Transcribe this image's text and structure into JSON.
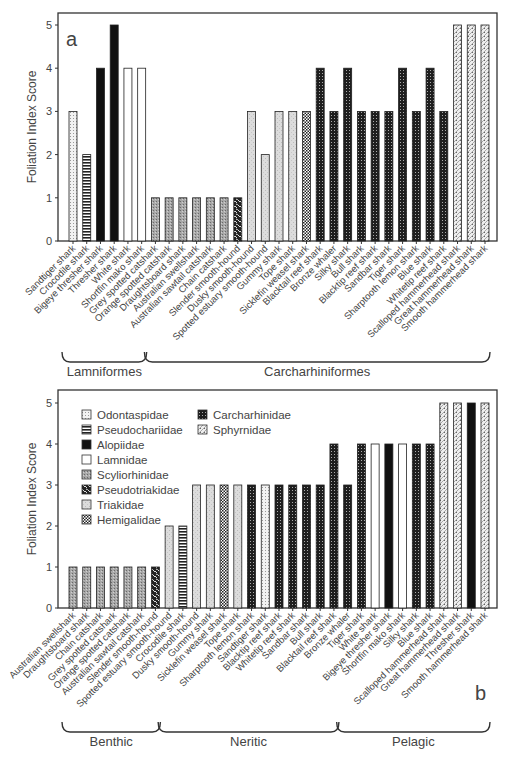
{
  "colors": {
    "frame": "#333333",
    "text": "#444444",
    "Odontaspidae": "#e4e4e4",
    "Pseudochariidae": "#222222",
    "Alopiidae": "#111111",
    "Lamnidae": "#ffffff",
    "Scyliorhinidae": "#9a9a9a",
    "Pseudotriakidae": "#2a2a2a",
    "Triakidae": "#d6d6d6",
    "Hemigalidae": "#555555",
    "Carcharhinidae": "#1e1e1e",
    "Sphyrnidae": "#cfcfcf"
  },
  "legend": {
    "entries": [
      {
        "family": "Odontaspidae"
      },
      {
        "family": "Pseudochariidae"
      },
      {
        "family": "Alopiidae"
      },
      {
        "family": "Lamnidae"
      },
      {
        "family": "Scyliorhinidae"
      },
      {
        "family": "Pseudotriakidae"
      },
      {
        "family": "Triakidae"
      },
      {
        "family": "Hemigalidae"
      },
      {
        "family": "Carcharhinidae"
      },
      {
        "family": "Sphyrnidae"
      }
    ]
  },
  "chart_data": [
    {
      "type": "bar",
      "panel_label": "a",
      "title": "",
      "xlabel": "",
      "ylabel": "Foliation Index Score",
      "ylim": [
        0,
        5
      ],
      "yticks": [
        0,
        1,
        2,
        3,
        4,
        5
      ],
      "grid": false,
      "categories": [
        "Sandtiger shark",
        "Crocodile shark",
        "Bigeye thresher shark",
        "Thresher shark",
        "White shark",
        "Shortfin mako shark",
        "Grey spotted catshark",
        "Orange spotted catshark",
        "Draughtsboard shark",
        "Australian swellshark",
        "Australian sawtail catshark",
        "Chain catshark",
        "Slender smooth-hound",
        "Dusky smooth-hound",
        "Spotted estuary smooth-hound",
        "Gummy shark",
        "Tope shark",
        "Sicklefin weasel shark",
        "Blacktail reef shark",
        "Bronze whaler",
        "Silky shark",
        "Bull shark",
        "Blacktip reef shark",
        "Sandbar shark",
        "Tiger shark",
        "Sharptooth lemon shark",
        "Blue shark",
        "Whitetip reef shark",
        "Scalloped hammerhead shark",
        "Great hammerhead shark",
        "Smooth hammerhead shark"
      ],
      "values": [
        3,
        2,
        4,
        5,
        4,
        4,
        1,
        1,
        1,
        1,
        1,
        1,
        1,
        3,
        2,
        3,
        3,
        3,
        4,
        3,
        4,
        3,
        3,
        3,
        4,
        3,
        4,
        3,
        5,
        5,
        5
      ],
      "families": [
        "Odontaspidae",
        "Pseudochariidae",
        "Alopiidae",
        "Alopiidae",
        "Lamnidae",
        "Lamnidae",
        "Scyliorhinidae",
        "Scyliorhinidae",
        "Scyliorhinidae",
        "Scyliorhinidae",
        "Scyliorhinidae",
        "Scyliorhinidae",
        "Pseudotriakidae",
        "Triakidae",
        "Triakidae",
        "Triakidae",
        "Triakidae",
        "Hemigalidae",
        "Carcharhinidae",
        "Carcharhinidae",
        "Carcharhinidae",
        "Carcharhinidae",
        "Carcharhinidae",
        "Carcharhinidae",
        "Carcharhinidae",
        "Carcharhinidae",
        "Carcharhinidae",
        "Carcharhinidae",
        "Sphyrnidae",
        "Sphyrnidae",
        "Sphyrnidae"
      ],
      "groups": [
        {
          "label": "Lamniformes",
          "from": 0,
          "to": 5
        },
        {
          "label": "Carcharhiniformes",
          "from": 6,
          "to": 30
        }
      ],
      "legend_position": "none"
    },
    {
      "type": "bar",
      "panel_label": "b",
      "title": "",
      "xlabel": "",
      "ylabel": "Foliation Index Score",
      "ylim": [
        0,
        5
      ],
      "yticks": [
        0,
        1,
        2,
        3,
        4,
        5
      ],
      "grid": false,
      "categories": [
        "Australian swellshark",
        "Draughtsboard shark",
        "Chain catshark",
        "Grey spotted catshark",
        "Orange spotted catshark",
        "Australian sawtail catshark",
        "Slender smooth-hound",
        "Spotted estuary smooth-hound",
        "Crocodile shark",
        "Dusky smooth-hound",
        "Gummy shark",
        "Sicklefin weasel shark",
        "Tope shark",
        "Sharptooth lemon shark",
        "Sandtiger shark",
        "Blacktip reef shark",
        "Whitetip reef shark",
        "Sandbar shark",
        "Bull shark",
        "Blacktail reef shark",
        "Bronze whaler",
        "Tiger shark",
        "White shark",
        "Bigeye thresher shark",
        "Shortfin mako shark",
        "Silky shark",
        "Blue shark",
        "Scalloped hammerhead shark",
        "Great hammerhead shark",
        "Thresher shark",
        "Smooth hammerhead shark"
      ],
      "values": [
        1,
        1,
        1,
        1,
        1,
        1,
        1,
        2,
        2,
        3,
        3,
        3,
        3,
        3,
        3,
        3,
        3,
        3,
        3,
        4,
        3,
        4,
        4,
        4,
        4,
        4,
        4,
        5,
        5,
        5,
        5
      ],
      "families": [
        "Scyliorhinidae",
        "Scyliorhinidae",
        "Scyliorhinidae",
        "Scyliorhinidae",
        "Scyliorhinidae",
        "Scyliorhinidae",
        "Pseudotriakidae",
        "Triakidae",
        "Pseudochariidae",
        "Triakidae",
        "Triakidae",
        "Hemigalidae",
        "Triakidae",
        "Carcharhinidae",
        "Odontaspidae",
        "Carcharhinidae",
        "Carcharhinidae",
        "Carcharhinidae",
        "Carcharhinidae",
        "Carcharhinidae",
        "Carcharhinidae",
        "Carcharhinidae",
        "Lamnidae",
        "Alopiidae",
        "Lamnidae",
        "Carcharhinidae",
        "Carcharhinidae",
        "Sphyrnidae",
        "Sphyrnidae",
        "Alopiidae",
        "Sphyrnidae"
      ],
      "groups": [
        {
          "label": "Benthic",
          "from": 0,
          "to": 6
        },
        {
          "label": "Neritic",
          "from": 7,
          "to": 19
        },
        {
          "label": "Pelagic",
          "from": 20,
          "to": 30
        }
      ],
      "legend_position": "upper left (inside plot)"
    }
  ]
}
